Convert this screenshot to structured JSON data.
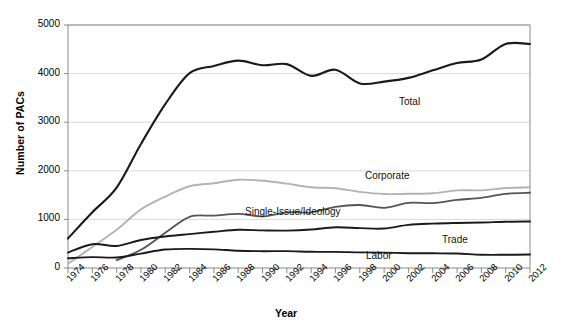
{
  "chart_data": {
    "type": "line",
    "title": "",
    "xlabel": "Year",
    "ylabel": "Number of PACs",
    "xlim": [
      1974,
      2012
    ],
    "ylim": [
      0,
      5000
    ],
    "yticks": [
      0,
      1000,
      2000,
      3000,
      4000,
      5000
    ],
    "grid": true,
    "legend_position": "inline-annotations",
    "x": [
      1974,
      1976,
      1978,
      1980,
      1982,
      1984,
      1986,
      1988,
      1990,
      1992,
      1994,
      1996,
      1998,
      2000,
      2002,
      2004,
      2006,
      2008,
      2010,
      2012
    ],
    "xticklabels": [
      "1974",
      "1976",
      "1978",
      "1980",
      "1982",
      "1984",
      "1986",
      "1988",
      "1990",
      "1992",
      "1994",
      "1996",
      "1998",
      "2000",
      "2002",
      "2004",
      "2006",
      "2008",
      "2010",
      "2012"
    ],
    "series": [
      {
        "name": "Total",
        "color": "#1a1a1a",
        "width": 2.1,
        "values": [
          608,
          1146,
          1653,
          2551,
          3371,
          4009,
          4157,
          4268,
          4172,
          4195,
          3954,
          4079,
          3798,
          3835,
          3912,
          4067,
          4217,
          4292,
          4611,
          4609
        ]
      },
      {
        "name": "Corporate",
        "color": "#b3b3b3",
        "width": 1.9,
        "values": [
          89,
          433,
          785,
          1206,
          1469,
          1682,
          1744,
          1816,
          1795,
          1735,
          1660,
          1642,
          1567,
          1523,
          1527,
          1538,
          1598,
          1598,
          1645,
          1660
        ]
      },
      {
        "name": "Single-Issue/Ideology",
        "color": "#555555",
        "width": 1.8,
        "values": [
          0,
          0,
          162,
          374,
          723,
          1053,
          1077,
          1115,
          1062,
          1145,
          1145,
          1259,
          1296,
          1239,
          1339,
          1336,
          1401,
          1443,
          1525,
          1548
        ]
      },
      {
        "name": "Trade",
        "color": "#1a1a1a",
        "width": 1.9,
        "values": [
          318,
          489,
          453,
          576,
          649,
          698,
          745,
          786,
          774,
          770,
          792,
          838,
          821,
          812,
          887,
          913,
          926,
          935,
          952,
          958
        ]
      },
      {
        "name": "Labor",
        "color": "#1a1a1a",
        "width": 1.9,
        "values": [
          201,
          224,
          217,
          297,
          380,
          394,
          384,
          354,
          346,
          347,
          333,
          332,
          321,
          316,
          305,
          302,
          297,
          273,
          272,
          277
        ]
      }
    ],
    "annotations": [
      {
        "text": "Total",
        "x_px": 399,
        "y_px": 96
      },
      {
        "text": "Corporate",
        "x_px": 365,
        "y_px": 170
      },
      {
        "text": "Single-Issue/Ideology",
        "x_px": 245,
        "y_px": 206
      },
      {
        "text": "Trade",
        "x_px": 442,
        "y_px": 234
      },
      {
        "text": "Labor",
        "x_px": 366,
        "y_px": 250
      }
    ]
  },
  "style": {
    "axis_color": "#8a8a8a",
    "grid_color": "#d9d9d9",
    "background": "#ffffff",
    "plot_background": "#ffffff"
  }
}
